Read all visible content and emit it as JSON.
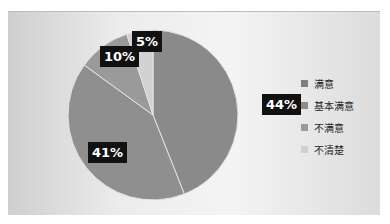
{
  "chart_data": {
    "type": "pie",
    "title": "",
    "categories": [
      "满意",
      "基本满意",
      "不满意",
      "不清楚"
    ],
    "values": [
      44,
      41,
      10,
      5
    ],
    "labels": [
      "44%",
      "41%",
      "10%",
      "5%"
    ],
    "colors": [
      "#8a8a8a",
      "#8f8f8f",
      "#9a9a9a",
      "#d2d2d2"
    ],
    "legend_position": "right"
  },
  "legend": {
    "items": [
      {
        "label": "满意",
        "color": "#7f7f7f"
      },
      {
        "label": "基本满意",
        "color": "#8c8c8c"
      },
      {
        "label": "不满意",
        "color": "#9a9a9a"
      },
      {
        "label": "不清楚",
        "color": "#cfcfcf"
      }
    ]
  }
}
